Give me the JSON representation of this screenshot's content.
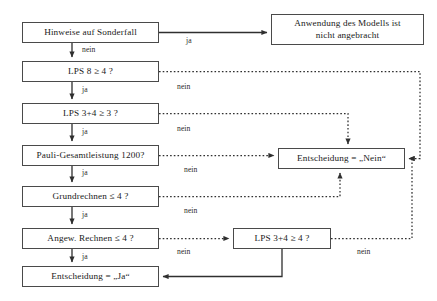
{
  "diagram": {
    "line_color": "#4a4a4a",
    "text_color": "#1a1a1a",
    "background": "#ffffff",
    "nodes": [
      {
        "id": "hinweise",
        "label": "Hinweise auf Sonderfall",
        "x": 22,
        "y": 22,
        "w": 137,
        "h": 21
      },
      {
        "id": "anwendung",
        "label": "Anwendung des Modells ist\nnicht angebracht",
        "x": 271,
        "y": 14,
        "w": 153,
        "h": 31
      },
      {
        "id": "lps8",
        "label": "LPS 8 ≥ 4 ?",
        "x": 22,
        "y": 61,
        "w": 137,
        "h": 21
      },
      {
        "id": "lps34_3",
        "label": "LPS 3+4 ≥ 3 ?",
        "x": 22,
        "y": 103,
        "w": 137,
        "h": 21
      },
      {
        "id": "pauli",
        "label": "Pauli-Gesamtleistung 1200?",
        "x": 22,
        "y": 145,
        "w": 137,
        "h": 21
      },
      {
        "id": "grundrechnen",
        "label": "Grundrechnen ≤ 4 ?",
        "x": 22,
        "y": 186,
        "w": 137,
        "h": 21
      },
      {
        "id": "angew",
        "label": "Angew. Rechnen ≤ 4 ?",
        "x": 22,
        "y": 228,
        "w": 137,
        "h": 21
      },
      {
        "id": "ent_ja",
        "label": "Entscheidung = „Ja“",
        "x": 22,
        "y": 266,
        "w": 137,
        "h": 21
      },
      {
        "id": "ent_nein",
        "label": "Entscheidung = „Nein“",
        "x": 278,
        "y": 148,
        "w": 127,
        "h": 21
      },
      {
        "id": "lps34_4",
        "label": "LPS  3+4 ≥ 4 ?",
        "x": 233,
        "y": 228,
        "w": 98,
        "h": 21
      }
    ],
    "edge_labels": [
      {
        "id": "ja-hinweise",
        "text": "ja",
        "x": 186,
        "y": 36
      },
      {
        "id": "nein-hinweise",
        "text": "nein",
        "x": 82,
        "y": 45
      },
      {
        "id": "ja-lps8",
        "text": "ja",
        "x": 82,
        "y": 85
      },
      {
        "id": "nein-lps8",
        "text": "nein",
        "x": 177,
        "y": 82
      },
      {
        "id": "ja-lps34-3",
        "text": "ja",
        "x": 82,
        "y": 127
      },
      {
        "id": "nein-lps34-3",
        "text": "nein",
        "x": 177,
        "y": 124
      },
      {
        "id": "ja-pauli",
        "text": "ja",
        "x": 82,
        "y": 168
      },
      {
        "id": "nein-pauli",
        "text": "nein",
        "x": 184,
        "y": 165
      },
      {
        "id": "ja-grundrechnen",
        "text": "ja",
        "x": 82,
        "y": 210
      },
      {
        "id": "nein-grund",
        "text": "nein",
        "x": 184,
        "y": 206
      },
      {
        "id": "ja-angew",
        "text": "ja",
        "x": 82,
        "y": 252
      },
      {
        "id": "nein-angew",
        "text": "nein",
        "x": 177,
        "y": 247
      },
      {
        "id": "nein-lps34-4",
        "text": "nein",
        "x": 357,
        "y": 247
      }
    ]
  }
}
